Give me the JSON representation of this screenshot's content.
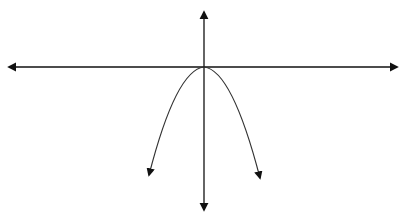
{
  "diagram": {
    "top_text_cropped": "",
    "colors": {
      "axes": "#111111",
      "curve": "#333333",
      "background": "#ffffff"
    },
    "x_axis": {
      "y": 67,
      "x_start": 9,
      "x_end": 397,
      "arrows": "both"
    },
    "y_axis": {
      "x": 204,
      "y_start": 12,
      "y_end": 210,
      "arrows": "both"
    },
    "curve": {
      "type": "parabola",
      "opens": "down",
      "vertex": [
        204,
        67
      ],
      "left_end": [
        149,
        175
      ],
      "right_end": [
        260,
        178
      ],
      "arrows": "both ends"
    }
  }
}
